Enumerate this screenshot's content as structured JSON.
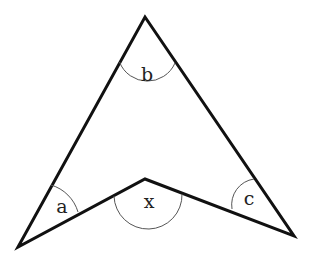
{
  "figure": {
    "type": "arrowhead-quadrilateral",
    "stroke_color": "#111111",
    "arc_color": "#555555",
    "vertices": {
      "apex": [
        145,
        17
      ],
      "left": [
        18,
        247
      ],
      "notch": [
        145,
        179
      ],
      "right": [
        294,
        236
      ]
    },
    "angles": [
      {
        "id": "a",
        "label": "a",
        "at": "left"
      },
      {
        "id": "b",
        "label": "b",
        "at": "apex"
      },
      {
        "id": "x",
        "label": "x",
        "at": "notch"
      },
      {
        "id": "c",
        "label": "c",
        "at": "right"
      }
    ]
  }
}
